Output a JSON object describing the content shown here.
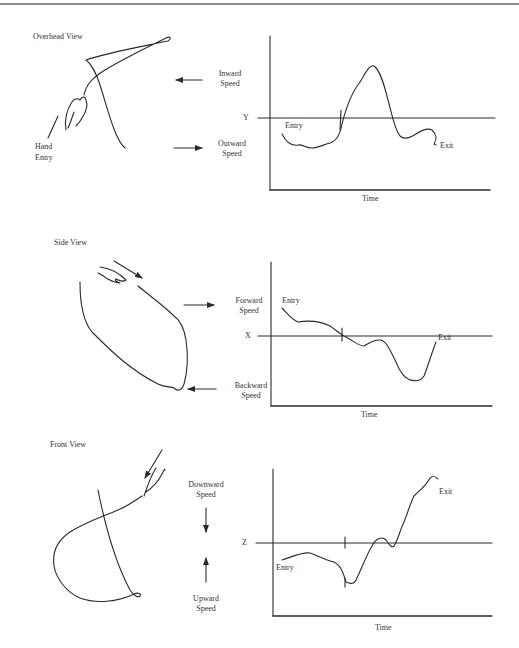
{
  "panels": [
    {
      "id": "overhead",
      "title": "Overhead View",
      "sketch_label": [
        "Hand",
        "Entry"
      ],
      "arrow_labels": {
        "top": [
          "Inward",
          "Speed"
        ],
        "bottom": [
          "Outward",
          "Speed"
        ]
      },
      "reference_axis": "Y",
      "curve_labels": {
        "start": "Entry",
        "end": "Exit"
      },
      "x_axis_label": "Time"
    },
    {
      "id": "side",
      "title": "Side View",
      "arrow_labels": {
        "top": [
          "Forward",
          "Speed"
        ],
        "bottom": [
          "Backward",
          "Speed"
        ]
      },
      "reference_axis": "X",
      "curve_labels": {
        "start": "Entry",
        "end": "Exit"
      },
      "x_axis_label": "Time"
    },
    {
      "id": "front",
      "title": "Front View",
      "arrow_labels": {
        "top": [
          "Downward",
          "Speed"
        ],
        "bottom": [
          "Upward",
          "Speed"
        ]
      },
      "reference_axis": "Z",
      "curve_labels": {
        "start": "Entry",
        "end": "Exit"
      },
      "x_axis_label": "Time"
    }
  ],
  "colors": {
    "ink": "#2a2a2a",
    "background": "#ffffff",
    "rule": "#8a8a8a"
  }
}
